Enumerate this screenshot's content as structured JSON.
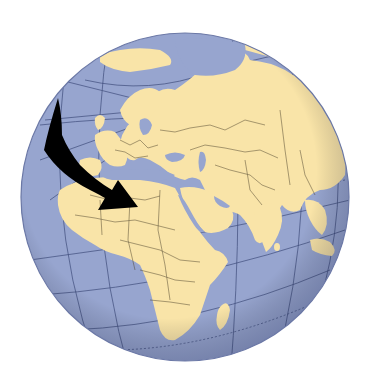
{
  "image": {
    "subject": "Globe centered on Europe, Africa and Asia with a curved black arrow pointing toward North Africa / Egypt",
    "colors": {
      "background": "#ffffff",
      "ocean": "#97a5cf",
      "land": "#f9e4a8",
      "borders": "#4a3f2a",
      "graticule": "#3c4a78",
      "arrow": "#000000",
      "limb_shadow": "#6b78a6"
    },
    "globe": {
      "cx": 185,
      "cy": 197,
      "r": 164
    },
    "arrow": {
      "points_to": "Egypt / North Africa",
      "direction": "down-right"
    },
    "regions_visible": [
      "Europe",
      "Africa",
      "Middle East",
      "Russia",
      "India",
      "Southeast Asia",
      "Indian Ocean",
      "Arctic Ocean",
      "Atlantic Ocean"
    ]
  }
}
